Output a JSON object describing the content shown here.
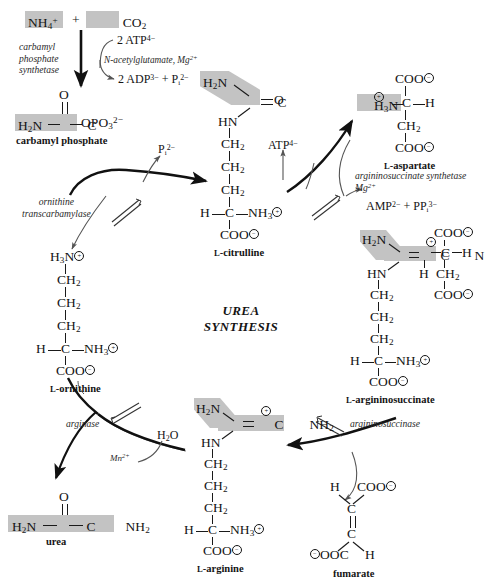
{
  "figure": {
    "title_line1": "UREA",
    "title_line2": "SYNTHESIS"
  },
  "reactants": {
    "ammonium": "NH4+",
    "plus": "+",
    "carbon_dioxide": "CO2"
  },
  "enzymes": {
    "cps_line1": "carbamyl",
    "cps_line2": "phosphate",
    "cps_line3": "synthetase",
    "otc_line1": "ornithine",
    "otc_line2": "transcarbamylase",
    "ass_line1": "argininosuccinate synthetase",
    "ass_line2": "Mg2+",
    "asl": "argininosuccinase",
    "arginase": "arginase"
  },
  "cofactors": {
    "atp_2": "2 ATP4−",
    "nag_mg": "N-acetylglutamate, Mg2+",
    "adp_pi": "2 ADP3− + Pi2−",
    "pi": "Pi2−",
    "atp": "ATP4−",
    "amp_ppi": "AMP2− + PPi3−",
    "water": "H2O",
    "manganese": "Mn2+"
  },
  "metabolites": {
    "carbamyl_phosphate": {
      "name": "carbamyl phosphate",
      "atoms": {
        "o_top": "O",
        "h2n": "H2N",
        "c": "C",
        "opo3": "OPO3 2−"
      }
    },
    "citrulline": {
      "name_sc": "L",
      "name": "-citrulline",
      "atoms": {
        "h2n": "H2N",
        "o": "O",
        "c": "C",
        "hn": "HN",
        "ch2_1": "CH2",
        "ch2_2": "CH2",
        "ch2_3": "CH2",
        "h": "H",
        "calpha": "C",
        "nh3": "NH3",
        "coo": "COO"
      }
    },
    "aspartate": {
      "name_sc": "L",
      "name": "-aspartate",
      "atoms": {
        "coo_top": "COO",
        "h3n": "H3N",
        "c": "C",
        "h": "H",
        "ch2": "CH2",
        "coo_bot": "COO"
      }
    },
    "argininosuccinate": {
      "name_sc": "L",
      "name": "-argininosuccinate",
      "atoms": {
        "h2n": "H2N",
        "c": "C",
        "n": "N",
        "h_under_n": "H",
        "hn": "HN",
        "ch2_1": "CH2",
        "ch2_2": "CH2",
        "ch2_3": "CH2",
        "h": "H",
        "calpha": "C",
        "nh3": "NH3",
        "coo": "COO",
        "coo_top": "COO",
        "c_side": "C",
        "h_side": "H",
        "ch2_side": "CH2",
        "coo_side": "COO"
      }
    },
    "ornithine": {
      "name_sc": "L",
      "name": "-ornithine",
      "atoms": {
        "h3n": "H3N",
        "ch2_1": "CH2",
        "ch2_2": "CH2",
        "ch2_3": "CH2",
        "h": "H",
        "calpha": "C",
        "nh3": "NH3",
        "coo": "COO"
      }
    },
    "arginine": {
      "name_sc": "L",
      "name": "-arginine",
      "atoms": {
        "h2n": "H2N",
        "c": "C",
        "nh2": "NH2",
        "hn": "HN",
        "ch2_1": "CH2",
        "ch2_2": "CH2",
        "ch2_3": "CH2",
        "h": "H",
        "calpha": "C",
        "nh3": "NH3",
        "coo": "COO"
      }
    },
    "urea": {
      "name": "urea",
      "atoms": {
        "o": "O",
        "h2n": "H2N",
        "c": "C",
        "nh2": "NH2"
      }
    },
    "fumarate": {
      "name": "fumarate",
      "atoms": {
        "h_top": "H",
        "coo_top": "COO",
        "c_top": "C",
        "c_bot": "C",
        "ooc": "OOC",
        "h_bot": "H"
      }
    }
  },
  "colors": {
    "highlight": "#c3c3c3",
    "ink": "#141414",
    "arrow": "#111111",
    "thin_arrow": "#555555"
  }
}
